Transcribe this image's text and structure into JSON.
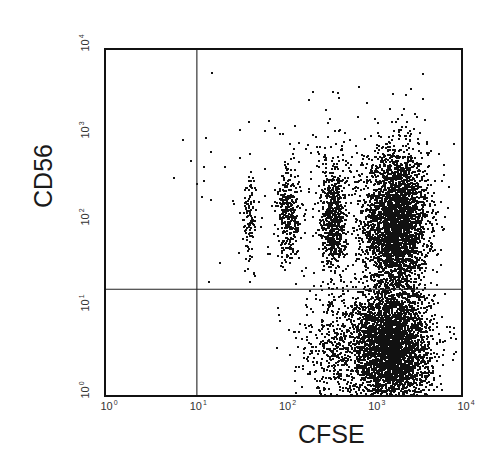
{
  "chart_data": {
    "type": "scatter",
    "subtype": "flow-cytometry-dot-plot",
    "title": "",
    "xlabel": "CFSE",
    "ylabel": "CD56",
    "x_scale": "log",
    "y_scale": "log",
    "xlim": [
      1,
      10000
    ],
    "ylim": [
      1,
      10000
    ],
    "x_ticks": [
      {
        "base": "10",
        "exp": "0"
      },
      {
        "base": "10",
        "exp": "1"
      },
      {
        "base": "10",
        "exp": "2"
      },
      {
        "base": "10",
        "exp": "3"
      },
      {
        "base": "10",
        "exp": "4"
      }
    ],
    "y_ticks": [
      {
        "base": "10",
        "exp": "0"
      },
      {
        "base": "10",
        "exp": "1"
      },
      {
        "base": "10",
        "exp": "2"
      },
      {
        "base": "10",
        "exp": "3"
      },
      {
        "base": "10",
        "exp": "4"
      }
    ],
    "grid": false,
    "legend": null,
    "quadrant_gates": {
      "x": 10.7,
      "y": 17
    },
    "populations_log10": [
      {
        "name": "undivided-bright (CFSE high, CD56 high)",
        "cx": 3.25,
        "cy": 2.0,
        "sx": 0.18,
        "sy": 0.42,
        "n": 3200
      },
      {
        "name": "undivided-dim (CFSE high, CD56 low)",
        "cx": 3.2,
        "cy": 0.55,
        "sx": 0.22,
        "sy": 0.35,
        "n": 3400
      },
      {
        "name": "division-1",
        "cx": 2.55,
        "cy": 2.05,
        "sx": 0.07,
        "sy": 0.32,
        "n": 650
      },
      {
        "name": "division-2",
        "cx": 2.05,
        "cy": 2.1,
        "sx": 0.07,
        "sy": 0.28,
        "n": 320
      },
      {
        "name": "division-3",
        "cx": 1.62,
        "cy": 2.05,
        "sx": 0.04,
        "sy": 0.25,
        "n": 110
      },
      {
        "name": "dim-tail",
        "cx": 2.6,
        "cy": 0.55,
        "sx": 0.25,
        "sy": 0.35,
        "n": 500
      },
      {
        "name": "scatter-background",
        "cx": 2.6,
        "cy": 2.4,
        "sx": 0.55,
        "sy": 0.55,
        "n": 180
      }
    ],
    "sparse_points_log10": [
      [
        0.76,
        2.52
      ],
      [
        0.95,
        2.72
      ],
      [
        1.02,
        2.45
      ],
      [
        1.12,
        2.98
      ],
      [
        1.18,
        2.82
      ],
      [
        1.33,
        2.65
      ],
      [
        1.42,
        2.26
      ],
      [
        1.5,
        2.12
      ],
      [
        1.28,
        1.55
      ],
      [
        1.15,
        1.32
      ],
      [
        1.67,
        1.4
      ],
      [
        1.56,
        1.45
      ],
      [
        3.55,
        3.72
      ],
      [
        3.42,
        3.55
      ],
      [
        3.36,
        3.48
      ],
      [
        1.08,
        2.3
      ],
      [
        1.5,
        2.75
      ]
    ]
  }
}
